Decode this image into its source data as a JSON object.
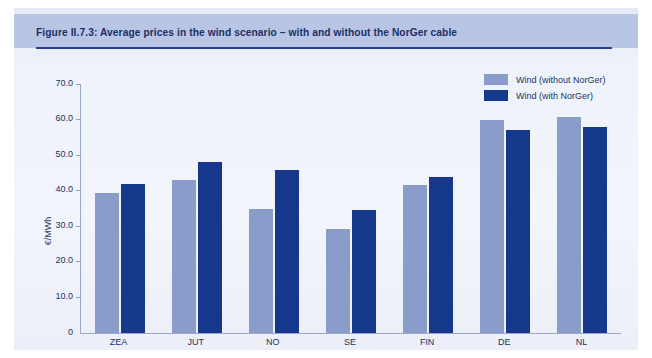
{
  "figure": {
    "title": "Figure II.7.3: Average prices in the wind scenario – with and without the NorGer cable"
  },
  "legend": {
    "items": [
      {
        "label": "Wind (without NorGer)",
        "color": "#8a9cc9"
      },
      {
        "label": "Wind (with NorGer)",
        "color": "#16388c"
      }
    ]
  },
  "axes": {
    "ylabel": "€/MWh",
    "yticks": [
      "70.0",
      "60.0",
      "50.0",
      "40.0",
      "30.0",
      "20.0",
      "10.0",
      "0"
    ]
  },
  "chart_data": {
    "type": "bar",
    "title": "Figure II.7.3: Average prices in the wind scenario – with and without the NorGer cable",
    "categories": [
      "ZEA",
      "JUT",
      "NO",
      "SE",
      "FIN",
      "DE",
      "NL"
    ],
    "series": [
      {
        "name": "Wind (without NorGer)",
        "color": "#8a9cc9",
        "values": [
          39.5,
          43.0,
          34.8,
          29.2,
          41.5,
          59.8,
          60.7
        ]
      },
      {
        "name": "Wind (with NorGer)",
        "color": "#16388c",
        "values": [
          41.8,
          48.0,
          45.8,
          34.5,
          44.0,
          57.0,
          58.0
        ]
      }
    ],
    "xlabel": "",
    "ylabel": "€/MWh",
    "ylim": [
      0,
      70
    ],
    "ytick_step": 10,
    "grid": false,
    "legend_position": "top-right"
  }
}
